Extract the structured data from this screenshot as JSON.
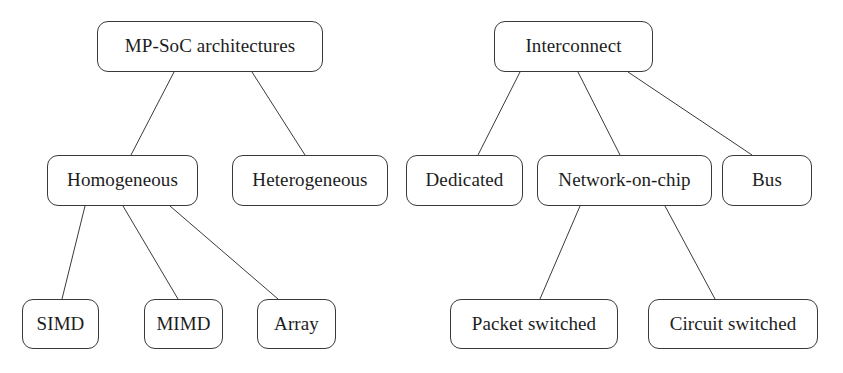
{
  "diagram": {
    "style": {
      "background_color": "#ffffff",
      "node_fill_color": "#ffffff",
      "node_border_color": "#3a3a3a",
      "edge_color": "#3a3a3a",
      "text_color": "#1d1d1d"
    },
    "trees": [
      {
        "name": "mp-soc-architectures-tree",
        "root": "MP-SoC architectures",
        "nodes": [
          {
            "id": "mp-soc",
            "label": "MP-SoC architectures",
            "level": 0,
            "x": 97,
            "y": 21,
            "w": 226,
            "h": 51
          },
          {
            "id": "homogeneous",
            "label": "Homogeneous",
            "level": 1,
            "x": 47,
            "y": 155,
            "w": 151,
            "h": 51
          },
          {
            "id": "heterogeneous",
            "label": "Heterogeneous",
            "level": 1,
            "x": 232,
            "y": 155,
            "w": 156,
            "h": 51
          },
          {
            "id": "simd",
            "label": "SIMD",
            "level": 2,
            "x": 22,
            "y": 299,
            "w": 77,
            "h": 50
          },
          {
            "id": "mimd",
            "label": "MIMD",
            "level": 2,
            "x": 144,
            "y": 299,
            "w": 79,
            "h": 50
          },
          {
            "id": "array",
            "label": "Array",
            "level": 2,
            "x": 257,
            "y": 299,
            "w": 79,
            "h": 50
          }
        ],
        "edges": [
          {
            "from": "mp-soc",
            "to": "homogeneous",
            "x1": 174,
            "y1": 72,
            "x2": 131,
            "y2": 155
          },
          {
            "from": "mp-soc",
            "to": "heterogeneous",
            "x1": 252,
            "y1": 72,
            "x2": 305,
            "y2": 155
          },
          {
            "from": "homogeneous",
            "to": "simd",
            "x1": 85,
            "y1": 206,
            "x2": 62,
            "y2": 299
          },
          {
            "from": "homogeneous",
            "to": "mimd",
            "x1": 123,
            "y1": 206,
            "x2": 178,
            "y2": 299
          },
          {
            "from": "homogeneous",
            "to": "array",
            "x1": 170,
            "y1": 206,
            "x2": 278,
            "y2": 299
          }
        ]
      },
      {
        "name": "interconnect-tree",
        "root": "Interconnect",
        "nodes": [
          {
            "id": "interconnect",
            "label": "Interconnect",
            "level": 0,
            "x": 494,
            "y": 21,
            "w": 159,
            "h": 51
          },
          {
            "id": "dedicated",
            "label": "Dedicated",
            "level": 1,
            "x": 406,
            "y": 155,
            "w": 117,
            "h": 51
          },
          {
            "id": "network-on-chip",
            "label": "Network-on-chip",
            "level": 1,
            "x": 537,
            "y": 155,
            "w": 175,
            "h": 51
          },
          {
            "id": "bus",
            "label": "Bus",
            "level": 1,
            "x": 722,
            "y": 155,
            "w": 90,
            "h": 51
          },
          {
            "id": "packet-switched",
            "label": "Packet switched",
            "level": 2,
            "x": 450,
            "y": 299,
            "w": 168,
            "h": 50
          },
          {
            "id": "circuit-switched",
            "label": "Circuit switched",
            "level": 2,
            "x": 648,
            "y": 299,
            "w": 170,
            "h": 50
          }
        ],
        "edges": [
          {
            "from": "interconnect",
            "to": "dedicated",
            "x1": 520,
            "y1": 72,
            "x2": 478,
            "y2": 155
          },
          {
            "from": "interconnect",
            "to": "network-on-chip",
            "x1": 578,
            "y1": 72,
            "x2": 620,
            "y2": 155
          },
          {
            "from": "interconnect",
            "to": "bus",
            "x1": 628,
            "y1": 72,
            "x2": 752,
            "y2": 155
          },
          {
            "from": "network-on-chip",
            "to": "packet-switched",
            "x1": 580,
            "y1": 206,
            "x2": 540,
            "y2": 299
          },
          {
            "from": "network-on-chip",
            "to": "circuit-switched",
            "x1": 665,
            "y1": 206,
            "x2": 715,
            "y2": 299
          }
        ]
      }
    ]
  }
}
